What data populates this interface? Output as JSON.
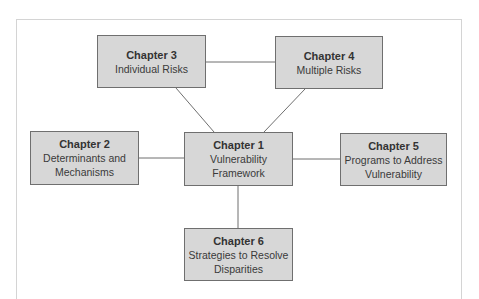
{
  "diagram": {
    "type": "hub-and-spoke",
    "colors": {
      "box_fill": "#d7d7d7",
      "box_border": "#6f6f6f",
      "line": "#6f6f6f",
      "frame": "#d4d4d4"
    },
    "nodes": [
      {
        "id": "ch1",
        "title": "Chapter 1",
        "subtitle": "Vulnerability\nFramework"
      },
      {
        "id": "ch2",
        "title": "Chapter 2",
        "subtitle": "Determinants and\nMechanisms"
      },
      {
        "id": "ch3",
        "title": "Chapter 3",
        "subtitle": "Individual Risks"
      },
      {
        "id": "ch4",
        "title": "Chapter 4",
        "subtitle": "Multiple Risks"
      },
      {
        "id": "ch5",
        "title": "Chapter 5",
        "subtitle": "Programs to Address\nVulnerability"
      },
      {
        "id": "ch6",
        "title": "Chapter 6",
        "subtitle": "Strategies to Resolve\nDisparities"
      }
    ],
    "edges": [
      [
        "ch1",
        "ch2"
      ],
      [
        "ch1",
        "ch3"
      ],
      [
        "ch1",
        "ch4"
      ],
      [
        "ch1",
        "ch5"
      ],
      [
        "ch1",
        "ch6"
      ],
      [
        "ch3",
        "ch4"
      ]
    ]
  }
}
